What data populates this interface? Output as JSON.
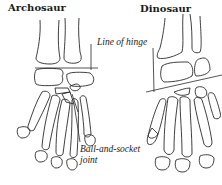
{
  "panels": [
    {
      "id": "archosaur",
      "title": "Archosaur"
    },
    {
      "id": "dinosaur",
      "title": "Dinosaur"
    }
  ],
  "labels": {
    "line_of_hinge": "Line of hinge",
    "ball_socket_1": "Ball-and-socket",
    "ball_socket_2": "joint"
  },
  "colors": {
    "stroke": "#2a2a2a",
    "background": "#ffffff",
    "text": "#1a1a1a"
  }
}
